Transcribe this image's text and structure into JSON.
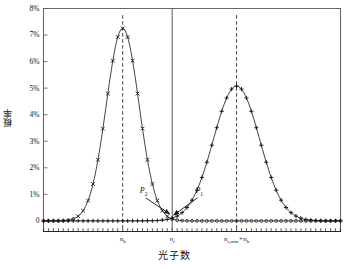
{
  "chart_data": {
    "type": "line",
    "title": "",
    "xlabel": "光子数",
    "ylabel": "概率",
    "grid": false,
    "legend": "none",
    "ylim": [
      -0.004,
      0.08
    ],
    "xlim": [
      0,
      120
    ],
    "ytick_labels": [
      "8%",
      "7%",
      "6%",
      "5%",
      "4%",
      "3%",
      "2%",
      "1%",
      "0"
    ],
    "ytick_values": [
      0.08,
      0.07,
      0.06,
      0.05,
      0.04,
      0.03,
      0.02,
      0.01,
      0
    ],
    "xtick_labels": [
      "n_b",
      "n_t",
      "n_s,min+n_b"
    ],
    "xtick_values": [
      32,
      52,
      78
    ],
    "series": [
      {
        "name": "P2-background-distribution",
        "marker": "x",
        "peak_x": 32,
        "peak_y": 0.0725,
        "sigma": 6.6,
        "color": "#111111"
      },
      {
        "name": "P1-signal-plus-background-distribution",
        "marker": "+",
        "peak_x": 78,
        "peak_y": 0.0508,
        "sigma": 9.3,
        "color": "#111111"
      }
    ],
    "annotations": [
      {
        "name": "P2",
        "label": "P",
        "sub": "2",
        "label_x": 40.5,
        "label_y": 0.0098,
        "arrow_to_x": 51.0,
        "arrow_to_y": 0.0026
      },
      {
        "name": "P1",
        "label": "P",
        "sub": "1",
        "label_x": 63.0,
        "label_y": 0.0098,
        "arrow_to_x": 52.6,
        "arrow_to_y": 0.0022
      }
    ],
    "vlines": [
      {
        "name": "threshold-line",
        "x": 52,
        "style": "solid"
      },
      {
        "name": "nb-peak-line",
        "x": 32,
        "style": "dashed"
      },
      {
        "name": "nsmin-nb-peak-line",
        "x": 78,
        "style": "dashed"
      }
    ],
    "axis_tick_count_x": 61
  },
  "axis": {
    "ylabel_text": "概率",
    "xlabel_text": "光子数"
  },
  "ticks": {
    "y": [
      {
        "label": "8%",
        "value": 0.08
      },
      {
        "label": "7%",
        "value": 0.07
      },
      {
        "label": "6%",
        "value": 0.06
      },
      {
        "label": "5%",
        "value": 0.05
      },
      {
        "label": "4%",
        "value": 0.04
      },
      {
        "label": "3%",
        "value": 0.03
      },
      {
        "label": "2%",
        "value": 0.02
      },
      {
        "label": "1%",
        "value": 0.01
      },
      {
        "label": "0",
        "value": 0.0
      }
    ],
    "x": [
      {
        "base": "n",
        "sub": "b",
        "value": 32
      },
      {
        "base": "n",
        "sub": "t",
        "value": 52
      },
      {
        "base": "n",
        "sub": "s,min",
        "tail": "+n",
        "tail_sub": "b",
        "value": 78
      }
    ]
  },
  "annotations": {
    "p2": {
      "base": "P",
      "sub": "2"
    },
    "p1": {
      "base": "P",
      "sub": "1"
    }
  },
  "colors": {
    "curve": "#111111",
    "axis": "#555555",
    "background": "#ffffff"
  }
}
